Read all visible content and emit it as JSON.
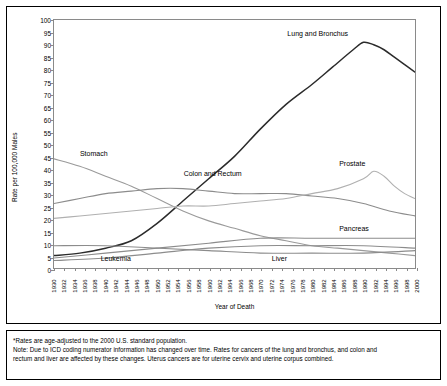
{
  "chart_data": {
    "type": "line",
    "title": "",
    "xlabel": "Year of Death",
    "ylabel": "Rate per 100,000 Males",
    "xlim": [
      1930,
      2000
    ],
    "ylim": [
      0,
      100
    ],
    "ytick_step": 5,
    "grid": false,
    "legend_position": "inline-labels",
    "xticks": [
      "1930",
      "1932",
      "1934",
      "1936",
      "1938",
      "1940",
      "1942",
      "1944",
      "1946",
      "1948",
      "1950",
      "1952",
      "1954",
      "1956",
      "1958",
      "1960",
      "1962",
      "1964",
      "1966",
      "1968",
      "1970",
      "1972",
      "1974",
      "1976",
      "1978",
      "1980",
      "1982",
      "1984",
      "1986",
      "1988",
      "1990",
      "1992",
      "1994",
      "1996",
      "1998",
      "2000"
    ],
    "yticks": [
      "0",
      "5",
      "10",
      "15",
      "20",
      "25",
      "30",
      "35",
      "40",
      "45",
      "50",
      "55",
      "60",
      "65",
      "70",
      "75",
      "80",
      "85",
      "90",
      "95",
      "100"
    ],
    "series": [
      {
        "name": "Lung and Bronchus",
        "color": "#2b2b2b",
        "x": [
          1930,
          1935,
          1940,
          1945,
          1950,
          1955,
          1960,
          1965,
          1970,
          1975,
          1980,
          1984,
          1988,
          1990,
          1992,
          1994,
          1996,
          1998,
          2000
        ],
        "values": [
          5,
          6,
          8,
          11,
          18,
          27,
          36,
          45,
          56,
          66,
          74,
          81,
          88,
          91,
          90,
          88,
          85,
          82,
          79
        ]
      },
      {
        "name": "Stomach",
        "color": "#9a9a9a",
        "x": [
          1930,
          1935,
          1940,
          1945,
          1950,
          1955,
          1960,
          1965,
          1970,
          1975,
          1980,
          1985,
          1990,
          1995,
          2000
        ],
        "values": [
          44,
          41,
          37,
          33,
          28,
          23,
          19,
          16,
          13,
          11,
          9,
          8,
          7,
          6,
          5
        ]
      },
      {
        "name": "Colon and Rectum",
        "color": "#8c8c8c",
        "x": [
          1930,
          1935,
          1940,
          1945,
          1950,
          1955,
          1960,
          1965,
          1970,
          1975,
          1980,
          1985,
          1990,
          1995,
          2000
        ],
        "values": [
          26,
          28,
          30,
          31,
          32,
          32,
          31,
          30,
          30,
          30,
          29,
          28,
          26,
          23,
          21
        ]
      },
      {
        "name": "Prostate",
        "color": "#b0b0b0",
        "x": [
          1930,
          1935,
          1940,
          1945,
          1950,
          1955,
          1960,
          1965,
          1970,
          1975,
          1980,
          1985,
          1990,
          1992,
          1994,
          1996,
          1998,
          2000
        ],
        "values": [
          20,
          21,
          22,
          23,
          24,
          25,
          25,
          26,
          27,
          28,
          30,
          32,
          36,
          39,
          37,
          33,
          30,
          28
        ]
      },
      {
        "name": "Pancreas",
        "color": "#8c8c8c",
        "x": [
          1930,
          1940,
          1950,
          1960,
          1970,
          1980,
          1990,
          2000
        ],
        "values": [
          4,
          6,
          8,
          10,
          12,
          12,
          12,
          12
        ]
      },
      {
        "name": "Leukemia",
        "color": "#8c8c8c",
        "x": [
          1930,
          1940,
          1950,
          1960,
          1970,
          1980,
          1990,
          2000
        ],
        "values": [
          3,
          4,
          6,
          8,
          9,
          9,
          9,
          8
        ]
      },
      {
        "name": "Liver",
        "color": "#8c8c8c",
        "x": [
          1930,
          1940,
          1950,
          1960,
          1970,
          1980,
          1990,
          2000
        ],
        "values": [
          9,
          9,
          8,
          7,
          6,
          6,
          6,
          7
        ]
      }
    ],
    "annotations": [
      {
        "text": "Lung and Bronchus",
        "x": 1975,
        "y": 94
      },
      {
        "text": "Stomach",
        "x": 1935,
        "y": 46
      },
      {
        "text": "Colon and Rectum",
        "x": 1955,
        "y": 38
      },
      {
        "text": "Prostate",
        "x": 1985,
        "y": 42
      },
      {
        "text": "Pancreas",
        "x": 1985,
        "y": 16
      },
      {
        "text": "Leukemia",
        "x": 1939,
        "y": 4
      },
      {
        "text": "Liver",
        "x": 1972,
        "y": 4
      }
    ]
  },
  "footnote": {
    "line1": "*Rates are age-adjusted to the 2000 U.S. standard population.",
    "line2": "Note: Due to ICD coding numerator information has changed over time. Rates for cancers of the lung and bronchus, and colon and",
    "line3": "rectum and liver are affected by these changes. Uterus cancers are for uterine cervix and uterine corpus combined."
  }
}
